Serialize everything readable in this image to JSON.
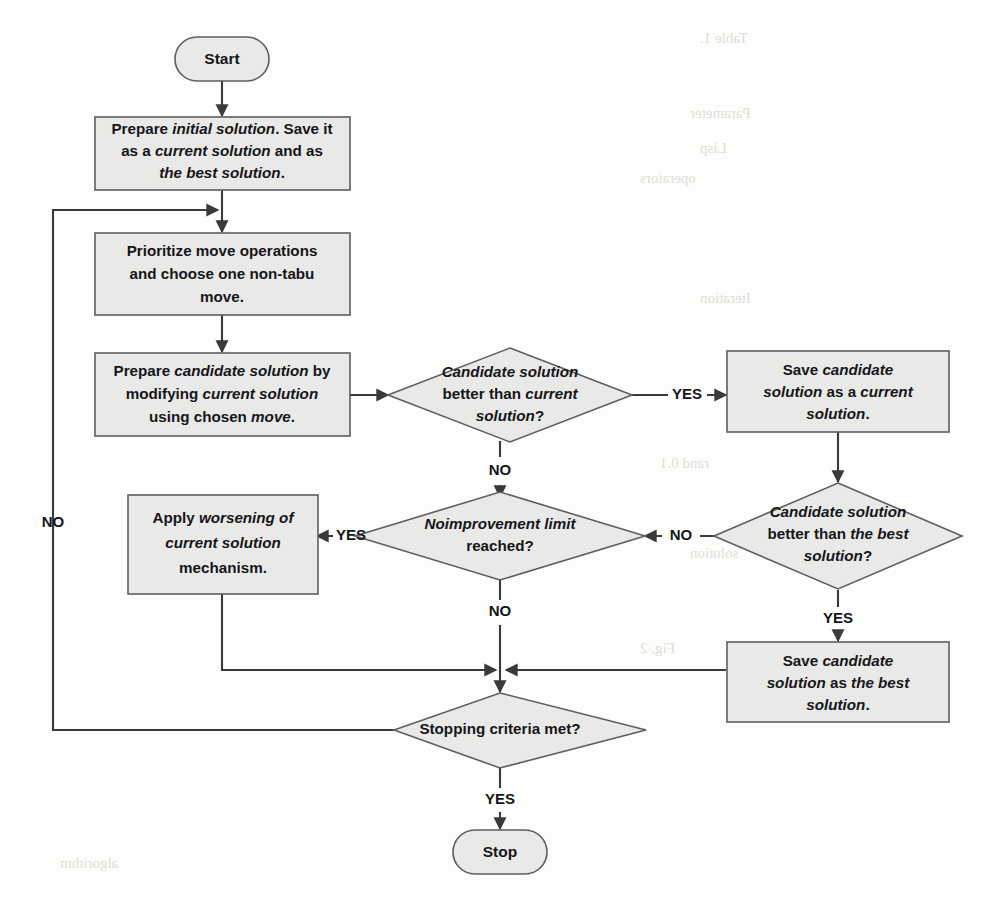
{
  "diagram": {
    "colors": {
      "shape_fill": "#e9e9e7",
      "shape_stroke": "#5e5e5e",
      "edge": "#3a3a3a",
      "text": "#15161a",
      "page_background": "#fdfdfc"
    },
    "nodes": {
      "start": {
        "type": "terminator",
        "label": "Start"
      },
      "prepare_initial": {
        "type": "process",
        "lines": [
          [
            {
              "t": "Prepare ",
              "i": false
            },
            {
              "t": "initial solution",
              "i": true
            },
            {
              "t": ". Save it",
              "i": false
            }
          ],
          [
            {
              "t": "as a ",
              "i": false
            },
            {
              "t": "current solution",
              "i": true
            },
            {
              "t": " and as",
              "i": false
            }
          ],
          [
            {
              "t": "the best solution",
              "i": true
            },
            {
              "t": ".",
              "i": false
            }
          ]
        ]
      },
      "prioritize_move": {
        "type": "process",
        "lines": [
          [
            {
              "t": "Prioritize move operations",
              "i": false
            }
          ],
          [
            {
              "t": "and choose one non-tabu",
              "i": false
            }
          ],
          [
            {
              "t": "move.",
              "i": false
            }
          ]
        ]
      },
      "prepare_candidate": {
        "type": "process",
        "lines": [
          [
            {
              "t": "Prepare ",
              "i": false
            },
            {
              "t": "candidate solution",
              "i": true
            },
            {
              "t": " by",
              "i": false
            }
          ],
          [
            {
              "t": "modifying ",
              "i": false
            },
            {
              "t": "current solution",
              "i": true
            }
          ],
          [
            {
              "t": "using chosen ",
              "i": false
            },
            {
              "t": "move",
              "i": true
            },
            {
              "t": ".",
              "i": false
            }
          ]
        ]
      },
      "better_than_current": {
        "type": "decision",
        "lines": [
          [
            {
              "t": "Candidate solution",
              "i": true
            }
          ],
          [
            {
              "t": "better than ",
              "i": false
            },
            {
              "t": "current",
              "i": true
            }
          ],
          [
            {
              "t": "solution",
              "i": true
            },
            {
              "t": "?",
              "i": false
            }
          ]
        ]
      },
      "save_as_current": {
        "type": "process",
        "lines": [
          [
            {
              "t": "Save ",
              "i": false
            },
            {
              "t": "candidate",
              "i": true
            }
          ],
          [
            {
              "t": "solution",
              "i": true
            },
            {
              "t": " as a ",
              "i": false
            },
            {
              "t": "current",
              "i": true
            }
          ],
          [
            {
              "t": "solution",
              "i": true
            },
            {
              "t": ".",
              "i": false
            }
          ]
        ]
      },
      "better_than_best": {
        "type": "decision",
        "lines": [
          [
            {
              "t": "Candidate solution",
              "i": true
            }
          ],
          [
            {
              "t": "better than ",
              "i": false
            },
            {
              "t": "the best",
              "i": true
            }
          ],
          [
            {
              "t": "solution",
              "i": true
            },
            {
              "t": "?",
              "i": false
            }
          ]
        ]
      },
      "save_as_best": {
        "type": "process",
        "lines": [
          [
            {
              "t": "Save ",
              "i": false
            },
            {
              "t": "candidate",
              "i": true
            }
          ],
          [
            {
              "t": "solution",
              "i": true
            },
            {
              "t": " as ",
              "i": false
            },
            {
              "t": "the best",
              "i": true
            }
          ],
          [
            {
              "t": "solution",
              "i": true
            },
            {
              "t": ".",
              "i": false
            }
          ]
        ]
      },
      "no_improvement_limit": {
        "type": "decision",
        "lines": [
          [
            {
              "t": "Noimprovement limit",
              "i": true
            }
          ],
          [
            {
              "t": "reached?",
              "i": false
            }
          ]
        ]
      },
      "apply_worsening": {
        "type": "process",
        "lines": [
          [
            {
              "t": "Apply ",
              "i": false
            },
            {
              "t": "worsening of",
              "i": true
            }
          ],
          [
            {
              "t": "current solution",
              "i": true
            }
          ],
          [
            {
              "t": "mechanism.",
              "i": false
            }
          ]
        ]
      },
      "stopping_criteria": {
        "type": "decision",
        "lines": [
          [
            {
              "t": "Stopping criteria met?",
              "i": false
            }
          ]
        ]
      },
      "stop": {
        "type": "terminator",
        "label": "Stop"
      }
    },
    "edge_labels": {
      "candidate_better_current_yes": "YES",
      "candidate_better_current_no": "NO",
      "candidate_better_best_no": "NO",
      "candidate_better_best_yes": "YES",
      "no_improvement_yes": "YES",
      "no_improvement_no": "NO",
      "stopping_no": "NO",
      "stopping_yes": "YES"
    }
  }
}
